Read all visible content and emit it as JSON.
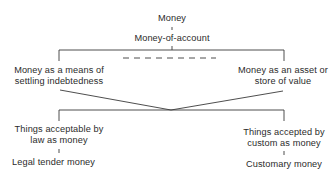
{
  "diagram": {
    "root": "Money",
    "account_node": "Money-of-account",
    "left_function": [
      "Money as a means of",
      "settling indebtedness"
    ],
    "right_function": [
      "Money as an asset or",
      "store of value"
    ],
    "left_acceptance": [
      "Things acceptable by",
      "law as money"
    ],
    "right_acceptance": [
      "Things accepted by",
      "custom as money"
    ],
    "left_type": "Legal tender money",
    "right_type": "Customary money"
  }
}
